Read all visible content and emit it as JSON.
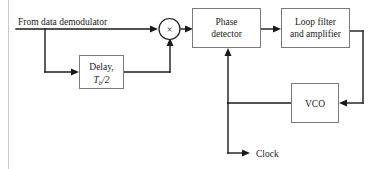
{
  "diagram": {
    "input_label": "From data demodulator",
    "output_label": "Clock",
    "blocks": [
      {
        "id": "delay",
        "line1": "Delay,",
        "symbol": "T",
        "subscript": "b",
        "symbol_rest": "/2"
      },
      {
        "id": "phase-detector",
        "line1": "Phase",
        "line2": "detector"
      },
      {
        "id": "loop-filter",
        "line1": "Loop filter",
        "line2": "and amplifier"
      },
      {
        "id": "vco",
        "line1": "VCO"
      }
    ],
    "multiplier": {
      "glyph": "×",
      "name": "multiplier"
    },
    "colors": {
      "wire": "#1a1a1a",
      "box_stroke": "#7a7a7a",
      "text": "#1a1a1a",
      "background": "#ffffff",
      "page_edge": "#c9c9c9"
    }
  }
}
